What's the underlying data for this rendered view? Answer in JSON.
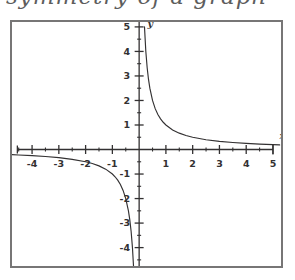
{
  "page": {
    "background_color": "#ffffff",
    "scan_ink_color": "#333132",
    "frame_border_color": "#777676"
  },
  "title_strip": {
    "handwritten_text_cut_off": "symmetry of a graph",
    "note": "top line of handwriting is cropped; only descenders visible"
  },
  "chart_data": {
    "type": "line",
    "title": "",
    "subtitle": "",
    "xlabel": "x",
    "ylabel": "y",
    "function": "y = 1/x",
    "grid": false,
    "legend": false,
    "legend_position": "none",
    "xlim": [
      -4.75,
      5.3
    ],
    "ylim": [
      -4.75,
      5.2
    ],
    "x_major_tick_labels": [
      "-4",
      "-3",
      "-2",
      "-1",
      "1",
      "2",
      "3",
      "4",
      "5"
    ],
    "x_major_tick_values": [
      -4,
      -3,
      -2,
      -1,
      1,
      2,
      3,
      4,
      5
    ],
    "y_major_tick_labels": [
      "5",
      "4",
      "3",
      "2",
      "1",
      "-1",
      "-2",
      "-3",
      "-4"
    ],
    "y_major_tick_values": [
      5,
      4,
      3,
      2,
      1,
      -1,
      -2,
      -3,
      -4
    ],
    "minor_tick_interval": 0.5,
    "origin_label": "",
    "series": [
      {
        "name": "branch-quadrant-I",
        "x": [
          0.2,
          0.25,
          0.3,
          0.35,
          0.4,
          0.5,
          0.6,
          0.7,
          0.8,
          0.9,
          1.0,
          1.25,
          1.5,
          1.75,
          2.0,
          2.5,
          3.0,
          3.5,
          4.0,
          4.5,
          5.0,
          5.25
        ],
        "values": [
          5.0,
          4.0,
          3.333,
          2.857,
          2.5,
          2.0,
          1.667,
          1.429,
          1.25,
          1.111,
          1.0,
          0.8,
          0.667,
          0.571,
          0.5,
          0.4,
          0.333,
          0.286,
          0.25,
          0.222,
          0.2,
          0.19
        ]
      },
      {
        "name": "branch-quadrant-III",
        "x": [
          -4.75,
          -4.5,
          -4.0,
          -3.5,
          -3.0,
          -2.5,
          -2.0,
          -1.75,
          -1.5,
          -1.25,
          -1.0,
          -0.9,
          -0.8,
          -0.7,
          -0.6,
          -0.5,
          -0.4,
          -0.35,
          -0.3,
          -0.25,
          -0.21
        ],
        "values": [
          -0.211,
          -0.222,
          -0.25,
          -0.286,
          -0.333,
          -0.4,
          -0.5,
          -0.571,
          -0.667,
          -0.8,
          -1.0,
          -1.111,
          -1.25,
          -1.429,
          -1.667,
          -2.0,
          -2.5,
          -2.857,
          -3.333,
          -4.0,
          -4.76
        ]
      }
    ],
    "annotations": [
      {
        "text": "x",
        "role": "x-axis-name",
        "at_x": 5.35,
        "at_y": 0.42
      },
      {
        "text": "y",
        "role": "y-axis-name",
        "at_x": 0.42,
        "at_y": 5.0
      }
    ]
  }
}
